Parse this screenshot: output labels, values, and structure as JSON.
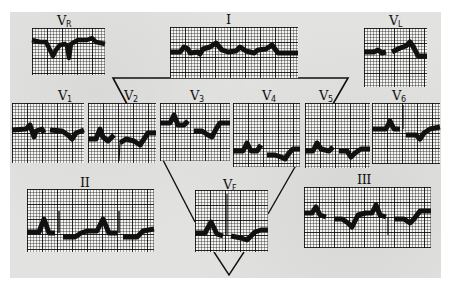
{
  "figure": {
    "type": "electrocardiogram lead montage",
    "background_color": "#e2e2e0",
    "trace_color": "#111111"
  },
  "leads": {
    "vr": {
      "label": "V",
      "sub": "R"
    },
    "i": {
      "label": "I",
      "sub": ""
    },
    "vl": {
      "label": "V",
      "sub": "L"
    },
    "v1": {
      "label": "V",
      "sub": "1"
    },
    "v2": {
      "label": "V",
      "sub": "2"
    },
    "v3": {
      "label": "V",
      "sub": "3"
    },
    "v4": {
      "label": "V",
      "sub": "4"
    },
    "v5": {
      "label": "V",
      "sub": "5"
    },
    "v6": {
      "label": "V",
      "sub": "6"
    },
    "ii": {
      "label": "II",
      "sub": ""
    },
    "vf": {
      "label": "V",
      "sub": "F"
    },
    "iii": {
      "label": "III",
      "sub": ""
    }
  },
  "connectors": {
    "upper_triangle": "inverted triangle linking the limb leads to the precordial row",
    "lower_triangle": "V-shaped triangle framing lead VF"
  }
}
